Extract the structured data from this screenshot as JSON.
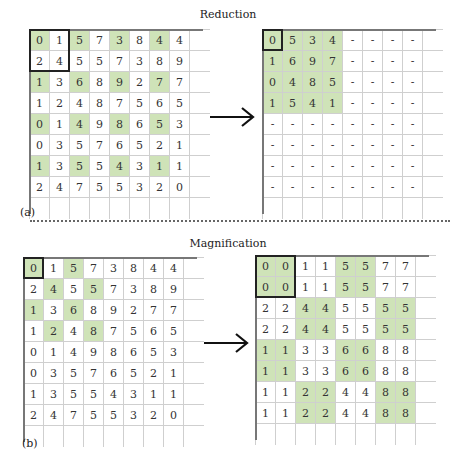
{
  "panels": {
    "a": {
      "title": "Reduction",
      "label": "(a)",
      "source": {
        "rows": [
          [
            "0",
            "1",
            "5",
            "7",
            "3",
            "8",
            "4",
            "4"
          ],
          [
            "2",
            "4",
            "5",
            "5",
            "7",
            "3",
            "8",
            "9"
          ],
          [
            "1",
            "3",
            "6",
            "8",
            "9",
            "2",
            "7",
            "7"
          ],
          [
            "1",
            "2",
            "4",
            "8",
            "7",
            "5",
            "6",
            "5"
          ],
          [
            "0",
            "1",
            "4",
            "9",
            "8",
            "6",
            "5",
            "3"
          ],
          [
            "0",
            "3",
            "5",
            "7",
            "6",
            "5",
            "2",
            "1"
          ],
          [
            "1",
            "3",
            "5",
            "5",
            "4",
            "3",
            "1",
            "1"
          ],
          [
            "2",
            "4",
            "7",
            "5",
            "5",
            "3",
            "2",
            "0"
          ]
        ],
        "highlight": [
          [
            1,
            0,
            1,
            0,
            1,
            0,
            1,
            0
          ],
          [
            0,
            0,
            0,
            0,
            0,
            0,
            0,
            0
          ],
          [
            1,
            0,
            1,
            0,
            1,
            0,
            1,
            0
          ],
          [
            0,
            0,
            0,
            0,
            0,
            0,
            0,
            0
          ],
          [
            1,
            0,
            1,
            0,
            1,
            0,
            1,
            0
          ],
          [
            0,
            0,
            0,
            0,
            0,
            0,
            0,
            0
          ],
          [
            1,
            0,
            1,
            0,
            1,
            0,
            1,
            0
          ],
          [
            0,
            0,
            0,
            0,
            0,
            0,
            0,
            0
          ]
        ],
        "bold_box": {
          "row": 0,
          "col": 0,
          "rows": 2,
          "cols": 2
        }
      },
      "result": {
        "rows": [
          [
            "0",
            "5",
            "3",
            "4",
            "-",
            "-",
            "-",
            "-"
          ],
          [
            "1",
            "6",
            "9",
            "7",
            "-",
            "-",
            "-",
            "-"
          ],
          [
            "0",
            "4",
            "8",
            "5",
            "-",
            "-",
            "-",
            "-"
          ],
          [
            "1",
            "5",
            "4",
            "1",
            "-",
            "-",
            "-",
            "-"
          ],
          [
            "-",
            "-",
            "-",
            "-",
            "-",
            "-",
            "-",
            "-"
          ],
          [
            "-",
            "-",
            "-",
            "-",
            "-",
            "-",
            "-",
            "-"
          ],
          [
            "-",
            "-",
            "-",
            "-",
            "-",
            "-",
            "-",
            "-"
          ],
          [
            "-",
            "-",
            "-",
            "-",
            "-",
            "-",
            "-",
            "-"
          ]
        ],
        "highlight": [
          [
            1,
            1,
            1,
            1,
            0,
            0,
            0,
            0
          ],
          [
            1,
            1,
            1,
            1,
            0,
            0,
            0,
            0
          ],
          [
            1,
            1,
            1,
            1,
            0,
            0,
            0,
            0
          ],
          [
            1,
            1,
            1,
            1,
            0,
            0,
            0,
            0
          ],
          [
            0,
            0,
            0,
            0,
            0,
            0,
            0,
            0
          ],
          [
            0,
            0,
            0,
            0,
            0,
            0,
            0,
            0
          ],
          [
            0,
            0,
            0,
            0,
            0,
            0,
            0,
            0
          ],
          [
            0,
            0,
            0,
            0,
            0,
            0,
            0,
            0
          ]
        ],
        "bold_box": {
          "row": 0,
          "col": 0,
          "rows": 1,
          "cols": 1
        }
      },
      "arrow": "right-arrow"
    },
    "b": {
      "title": "Magnification",
      "label": "(b)",
      "source": {
        "rows": [
          [
            "0",
            "1",
            "5",
            "7",
            "3",
            "8",
            "4",
            "4"
          ],
          [
            "2",
            "4",
            "5",
            "5",
            "7",
            "3",
            "8",
            "9"
          ],
          [
            "1",
            "3",
            "6",
            "8",
            "9",
            "2",
            "7",
            "7"
          ],
          [
            "1",
            "2",
            "4",
            "8",
            "7",
            "5",
            "6",
            "5"
          ],
          [
            "0",
            "1",
            "4",
            "9",
            "8",
            "6",
            "5",
            "3"
          ],
          [
            "0",
            "3",
            "5",
            "7",
            "6",
            "5",
            "2",
            "1"
          ],
          [
            "1",
            "3",
            "5",
            "5",
            "4",
            "3",
            "1",
            "1"
          ],
          [
            "2",
            "4",
            "7",
            "5",
            "5",
            "3",
            "2",
            "0"
          ]
        ],
        "highlight": [
          [
            1,
            0,
            1,
            0,
            0,
            0,
            0,
            0
          ],
          [
            0,
            1,
            0,
            1,
            0,
            0,
            0,
            0
          ],
          [
            1,
            0,
            1,
            0,
            0,
            0,
            0,
            0
          ],
          [
            0,
            1,
            0,
            1,
            0,
            0,
            0,
            0
          ],
          [
            0,
            0,
            0,
            0,
            0,
            0,
            0,
            0
          ],
          [
            0,
            0,
            0,
            0,
            0,
            0,
            0,
            0
          ],
          [
            0,
            0,
            0,
            0,
            0,
            0,
            0,
            0
          ],
          [
            0,
            0,
            0,
            0,
            0,
            0,
            0,
            0
          ]
        ],
        "bold_box": {
          "row": 0,
          "col": 0,
          "rows": 1,
          "cols": 1
        }
      },
      "result": {
        "rows": [
          [
            "0",
            "0",
            "1",
            "1",
            "5",
            "5",
            "7",
            "7"
          ],
          [
            "0",
            "0",
            "1",
            "1",
            "5",
            "5",
            "7",
            "7"
          ],
          [
            "2",
            "2",
            "4",
            "4",
            "5",
            "5",
            "5",
            "5"
          ],
          [
            "2",
            "2",
            "4",
            "4",
            "5",
            "5",
            "5",
            "5"
          ],
          [
            "1",
            "1",
            "3",
            "3",
            "6",
            "6",
            "8",
            "8"
          ],
          [
            "1",
            "1",
            "3",
            "3",
            "6",
            "6",
            "8",
            "8"
          ],
          [
            "1",
            "1",
            "2",
            "2",
            "4",
            "4",
            "8",
            "8"
          ],
          [
            "1",
            "1",
            "2",
            "2",
            "4",
            "4",
            "8",
            "8"
          ]
        ],
        "highlight": [
          [
            1,
            1,
            0,
            0,
            1,
            1,
            0,
            0
          ],
          [
            1,
            1,
            0,
            0,
            1,
            1,
            0,
            0
          ],
          [
            0,
            0,
            1,
            1,
            0,
            0,
            1,
            1
          ],
          [
            0,
            0,
            1,
            1,
            0,
            0,
            1,
            1
          ],
          [
            1,
            1,
            0,
            0,
            1,
            1,
            0,
            0
          ],
          [
            1,
            1,
            0,
            0,
            1,
            1,
            0,
            0
          ],
          [
            0,
            0,
            1,
            1,
            0,
            0,
            1,
            1
          ],
          [
            0,
            0,
            1,
            1,
            0,
            0,
            1,
            1
          ]
        ],
        "bold_box": {
          "row": 0,
          "col": 0,
          "rows": 2,
          "cols": 2
        }
      },
      "arrow": "right-arrow"
    }
  },
  "colors": {
    "highlight": "#cfe3b8",
    "grid_line": "#cfcfcf",
    "bold_border": "#222222"
  }
}
